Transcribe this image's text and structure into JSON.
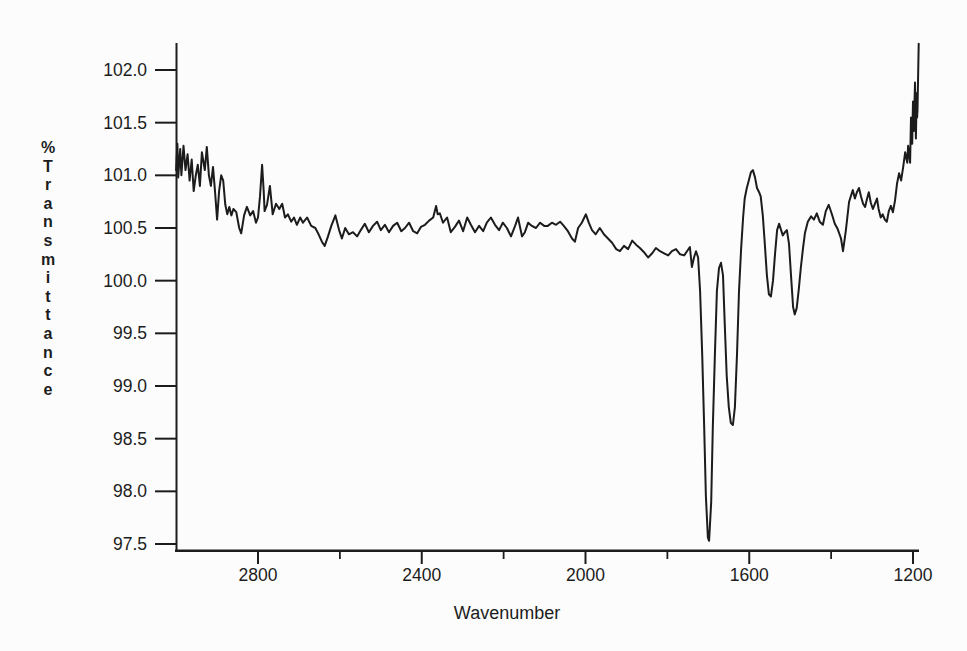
{
  "figure": {
    "background": "#fcfcfc",
    "line_color": "#1c1c1c"
  },
  "chart_data": {
    "type": "line",
    "title": "",
    "xlabel": "Wavenumber",
    "ylabel": "% Transmittance",
    "legend": "none",
    "grid": false,
    "x_axis": {
      "direction": "decreasing",
      "major_tick_labels": [
        "2800",
        "2400",
        "2000",
        "1600",
        "1200"
      ],
      "minor_ticks": [
        2600,
        2200,
        1800,
        1400
      ],
      "range": [
        3006,
        1186
      ]
    },
    "y_axis": {
      "major_tick_labels": [
        "102.0",
        "101.5",
        "101.0",
        "100.5",
        "100.0",
        "99.5",
        "99.0",
        "98.5",
        "98.0",
        "97.5"
      ],
      "range": [
        97.43,
        102.35
      ]
    },
    "series": [
      {
        "name": "IR spectrum trace",
        "points": [
          [
            3000,
            101.05
          ],
          [
            2997,
            101.3
          ],
          [
            2995,
            100.98
          ],
          [
            2990,
            101.25
          ],
          [
            2987,
            101.0
          ],
          [
            2982,
            101.28
          ],
          [
            2977,
            101.05
          ],
          [
            2972,
            101.2
          ],
          [
            2967,
            100.95
          ],
          [
            2962,
            101.15
          ],
          [
            2957,
            100.85
          ],
          [
            2952,
            101.0
          ],
          [
            2947,
            101.1
          ],
          [
            2942,
            100.9
          ],
          [
            2937,
            101.22
          ],
          [
            2930,
            101.05
          ],
          [
            2925,
            101.27
          ],
          [
            2920,
            101.0
          ],
          [
            2915,
            100.9
          ],
          [
            2910,
            101.08
          ],
          [
            2905,
            100.85
          ],
          [
            2900,
            100.58
          ],
          [
            2895,
            100.85
          ],
          [
            2890,
            101.0
          ],
          [
            2885,
            100.95
          ],
          [
            2880,
            100.72
          ],
          [
            2875,
            100.63
          ],
          [
            2870,
            100.7
          ],
          [
            2865,
            100.62
          ],
          [
            2860,
            100.68
          ],
          [
            2853,
            100.65
          ],
          [
            2846,
            100.5
          ],
          [
            2841,
            100.45
          ],
          [
            2834,
            100.62
          ],
          [
            2827,
            100.7
          ],
          [
            2819,
            100.62
          ],
          [
            2812,
            100.66
          ],
          [
            2805,
            100.55
          ],
          [
            2800,
            100.6
          ],
          [
            2795,
            100.8
          ],
          [
            2790,
            101.1
          ],
          [
            2786,
            100.85
          ],
          [
            2784,
            100.66
          ],
          [
            2778,
            100.72
          ],
          [
            2771,
            100.9
          ],
          [
            2764,
            100.63
          ],
          [
            2756,
            100.73
          ],
          [
            2748,
            100.68
          ],
          [
            2741,
            100.73
          ],
          [
            2734,
            100.6
          ],
          [
            2727,
            100.63
          ],
          [
            2719,
            100.56
          ],
          [
            2712,
            100.6
          ],
          [
            2705,
            100.53
          ],
          [
            2697,
            100.6
          ],
          [
            2690,
            100.55
          ],
          [
            2680,
            100.6
          ],
          [
            2670,
            100.52
          ],
          [
            2660,
            100.5
          ],
          [
            2652,
            100.44
          ],
          [
            2644,
            100.37
          ],
          [
            2637,
            100.33
          ],
          [
            2629,
            100.42
          ],
          [
            2621,
            100.52
          ],
          [
            2611,
            100.62
          ],
          [
            2602,
            100.48
          ],
          [
            2595,
            100.4
          ],
          [
            2587,
            100.5
          ],
          [
            2578,
            100.44
          ],
          [
            2568,
            100.46
          ],
          [
            2558,
            100.42
          ],
          [
            2549,
            100.48
          ],
          [
            2539,
            100.54
          ],
          [
            2529,
            100.46
          ],
          [
            2519,
            100.52
          ],
          [
            2509,
            100.56
          ],
          [
            2500,
            100.48
          ],
          [
            2490,
            100.53
          ],
          [
            2480,
            100.46
          ],
          [
            2470,
            100.52
          ],
          [
            2460,
            100.55
          ],
          [
            2450,
            100.47
          ],
          [
            2441,
            100.5
          ],
          [
            2431,
            100.55
          ],
          [
            2421,
            100.47
          ],
          [
            2411,
            100.45
          ],
          [
            2402,
            100.51
          ],
          [
            2392,
            100.53
          ],
          [
            2382,
            100.57
          ],
          [
            2372,
            100.6
          ],
          [
            2365,
            100.71
          ],
          [
            2361,
            100.63
          ],
          [
            2356,
            100.64
          ],
          [
            2348,
            100.55
          ],
          [
            2338,
            100.6
          ],
          [
            2329,
            100.46
          ],
          [
            2319,
            100.51
          ],
          [
            2309,
            100.57
          ],
          [
            2299,
            100.47
          ],
          [
            2289,
            100.6
          ],
          [
            2280,
            100.53
          ],
          [
            2270,
            100.46
          ],
          [
            2260,
            100.52
          ],
          [
            2250,
            100.47
          ],
          [
            2241,
            100.55
          ],
          [
            2231,
            100.6
          ],
          [
            2221,
            100.53
          ],
          [
            2211,
            100.48
          ],
          [
            2202,
            100.55
          ],
          [
            2192,
            100.5
          ],
          [
            2182,
            100.42
          ],
          [
            2172,
            100.52
          ],
          [
            2165,
            100.6
          ],
          [
            2155,
            100.42
          ],
          [
            2148,
            100.46
          ],
          [
            2140,
            100.55
          ],
          [
            2131,
            100.52
          ],
          [
            2121,
            100.5
          ],
          [
            2111,
            100.55
          ],
          [
            2101,
            100.52
          ],
          [
            2092,
            100.52
          ],
          [
            2082,
            100.55
          ],
          [
            2072,
            100.53
          ],
          [
            2062,
            100.56
          ],
          [
            2053,
            100.52
          ],
          [
            2043,
            100.47
          ],
          [
            2033,
            100.4
          ],
          [
            2026,
            100.37
          ],
          [
            2018,
            100.5
          ],
          [
            2009,
            100.55
          ],
          [
            1999,
            100.63
          ],
          [
            1992,
            100.55
          ],
          [
            1984,
            100.48
          ],
          [
            1975,
            100.44
          ],
          [
            1965,
            100.5
          ],
          [
            1955,
            100.44
          ],
          [
            1945,
            100.4
          ],
          [
            1935,
            100.36
          ],
          [
            1925,
            100.3
          ],
          [
            1916,
            100.28
          ],
          [
            1906,
            100.33
          ],
          [
            1896,
            100.3
          ],
          [
            1886,
            100.38
          ],
          [
            1876,
            100.34
          ],
          [
            1867,
            100.31
          ],
          [
            1857,
            100.27
          ],
          [
            1847,
            100.22
          ],
          [
            1837,
            100.26
          ],
          [
            1828,
            100.31
          ],
          [
            1818,
            100.28
          ],
          [
            1808,
            100.26
          ],
          [
            1798,
            100.24
          ],
          [
            1789,
            100.28
          ],
          [
            1779,
            100.3
          ],
          [
            1769,
            100.25
          ],
          [
            1759,
            100.24
          ],
          [
            1752,
            100.28
          ],
          [
            1745,
            100.32
          ],
          [
            1740,
            100.13
          ],
          [
            1735,
            100.22
          ],
          [
            1730,
            100.28
          ],
          [
            1725,
            100.22
          ],
          [
            1720,
            99.9
          ],
          [
            1715,
            99.3
          ],
          [
            1710,
            98.6
          ],
          [
            1706,
            97.95
          ],
          [
            1701,
            97.56
          ],
          [
            1698,
            97.53
          ],
          [
            1693,
            97.9
          ],
          [
            1689,
            98.6
          ],
          [
            1684,
            99.3
          ],
          [
            1679,
            99.9
          ],
          [
            1674,
            100.12
          ],
          [
            1669,
            100.17
          ],
          [
            1664,
            100.05
          ],
          [
            1660,
            99.6
          ],
          [
            1655,
            99.1
          ],
          [
            1650,
            98.8
          ],
          [
            1645,
            98.65
          ],
          [
            1640,
            98.63
          ],
          [
            1635,
            98.8
          ],
          [
            1630,
            99.3
          ],
          [
            1625,
            99.9
          ],
          [
            1620,
            100.3
          ],
          [
            1615,
            100.6
          ],
          [
            1611,
            100.78
          ],
          [
            1606,
            100.88
          ],
          [
            1601,
            100.95
          ],
          [
            1596,
            101.03
          ],
          [
            1591,
            101.05
          ],
          [
            1586,
            100.98
          ],
          [
            1581,
            100.88
          ],
          [
            1576,
            100.84
          ],
          [
            1572,
            100.8
          ],
          [
            1567,
            100.62
          ],
          [
            1562,
            100.35
          ],
          [
            1557,
            100.05
          ],
          [
            1552,
            99.87
          ],
          [
            1547,
            99.85
          ],
          [
            1542,
            100.0
          ],
          [
            1537,
            100.25
          ],
          [
            1532,
            100.48
          ],
          [
            1527,
            100.54
          ],
          [
            1523,
            100.49
          ],
          [
            1518,
            100.43
          ],
          [
            1513,
            100.46
          ],
          [
            1508,
            100.48
          ],
          [
            1503,
            100.35
          ],
          [
            1498,
            100.05
          ],
          [
            1493,
            99.75
          ],
          [
            1489,
            99.68
          ],
          [
            1484,
            99.74
          ],
          [
            1479,
            99.92
          ],
          [
            1474,
            100.12
          ],
          [
            1469,
            100.3
          ],
          [
            1464,
            100.45
          ],
          [
            1457,
            100.56
          ],
          [
            1449,
            100.61
          ],
          [
            1442,
            100.58
          ],
          [
            1435,
            100.64
          ],
          [
            1428,
            100.56
          ],
          [
            1420,
            100.53
          ],
          [
            1413,
            100.66
          ],
          [
            1406,
            100.72
          ],
          [
            1398,
            100.63
          ],
          [
            1391,
            100.54
          ],
          [
            1384,
            100.49
          ],
          [
            1376,
            100.4
          ],
          [
            1371,
            100.28
          ],
          [
            1364,
            100.48
          ],
          [
            1356,
            100.75
          ],
          [
            1352,
            100.8
          ],
          [
            1347,
            100.86
          ],
          [
            1342,
            100.78
          ],
          [
            1337,
            100.84
          ],
          [
            1332,
            100.88
          ],
          [
            1327,
            100.8
          ],
          [
            1322,
            100.73
          ],
          [
            1317,
            100.7
          ],
          [
            1312,
            100.78
          ],
          [
            1308,
            100.84
          ],
          [
            1303,
            100.74
          ],
          [
            1298,
            100.68
          ],
          [
            1293,
            100.73
          ],
          [
            1288,
            100.78
          ],
          [
            1284,
            100.68
          ],
          [
            1279,
            100.6
          ],
          [
            1274,
            100.63
          ],
          [
            1269,
            100.58
          ],
          [
            1264,
            100.56
          ],
          [
            1259,
            100.66
          ],
          [
            1254,
            100.71
          ],
          [
            1249,
            100.65
          ],
          [
            1244,
            100.76
          ],
          [
            1239,
            100.92
          ],
          [
            1234,
            101.02
          ],
          [
            1229,
            100.95
          ],
          [
            1224,
            101.08
          ],
          [
            1219,
            101.22
          ],
          [
            1214,
            101.12
          ],
          [
            1212,
            101.28
          ],
          [
            1207,
            101.12
          ],
          [
            1205,
            101.55
          ],
          [
            1202,
            101.3
          ],
          [
            1200,
            101.7
          ],
          [
            1198,
            101.42
          ],
          [
            1195,
            101.88
          ],
          [
            1193,
            101.35
          ],
          [
            1191,
            101.78
          ],
          [
            1190,
            101.55
          ],
          [
            1189,
            101.62
          ],
          [
            1186,
            102.25
          ]
        ]
      }
    ]
  }
}
